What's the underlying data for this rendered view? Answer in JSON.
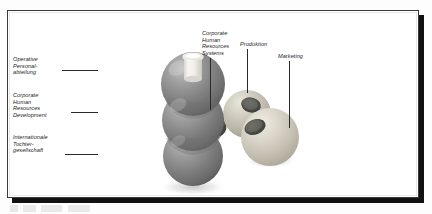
{
  "figure": {
    "kind": "3d-sphere-diagram",
    "alt_title": "Organisation der Personalfunktion",
    "background_color": "#ffffff",
    "frame_color": "#3a3a3a",
    "shadow_color": "#111111"
  },
  "labels": {
    "left": [
      {
        "name": "label-operative-personalabteilung",
        "lines": [
          "Operative",
          "Personal-",
          "abteilung"
        ],
        "text": "Operative Personal-abteilung"
      },
      {
        "name": "label-corporate-hr-development",
        "lines": [
          "Corporate",
          "Human",
          "Resources",
          "Development"
        ],
        "text": "Corporate Human Resources Development"
      },
      {
        "name": "label-internationale-tochtergesellschaft",
        "lines": [
          "Internationale",
          "Tochter-",
          "gesellschaft"
        ],
        "text": "Internationale Tochter-gesellschaft"
      }
    ],
    "top": [
      {
        "name": "label-corporate-hr-systems",
        "lines": [
          "Corporate",
          "Human",
          "Resources",
          "Systems"
        ],
        "text": "Corporate Human Resources Systems"
      },
      {
        "name": "label-produktion",
        "lines": [
          "Produktion"
        ],
        "text": "Produktion"
      },
      {
        "name": "label-marketing",
        "lines": [
          "Marketing"
        ],
        "text": "Marketing"
      }
    ]
  },
  "objects": {
    "cap": {
      "name": "white-cylinder-cap",
      "color": "#f2f1ee"
    },
    "dark_spheres": [
      {
        "name": "dark-sphere-top",
        "color": "#8e8e8e"
      },
      {
        "name": "dark-sphere-middle",
        "color": "#8a8a8a"
      },
      {
        "name": "dark-sphere-bottom",
        "color": "#8c8c8c"
      }
    ],
    "beads": [
      {
        "name": "bead-gray",
        "color": "#a6a6a2"
      },
      {
        "name": "bead-beige",
        "color": "#c9c6bb"
      },
      {
        "name": "bead-light",
        "color": "#d6d3c8"
      }
    ],
    "hole_color": "#4a4a48"
  },
  "colors": {
    "ink": "#1d1d1d",
    "leader": "#2a2a2a",
    "paper": "#ffffff"
  }
}
